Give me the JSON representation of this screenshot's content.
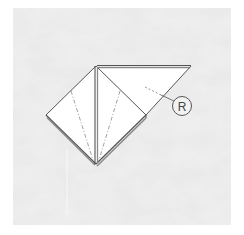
{
  "diagram": {
    "type": "origami-fold-step",
    "label": "R",
    "label_meaning": "reverse fold",
    "colors": {
      "background_texture": "#d9d9d9",
      "background_light": "#eeeeee",
      "paper": "#ffffff",
      "edge": "#555555",
      "edge_shadow": "#8a8a8a",
      "fold_line": "#888888"
    }
  }
}
